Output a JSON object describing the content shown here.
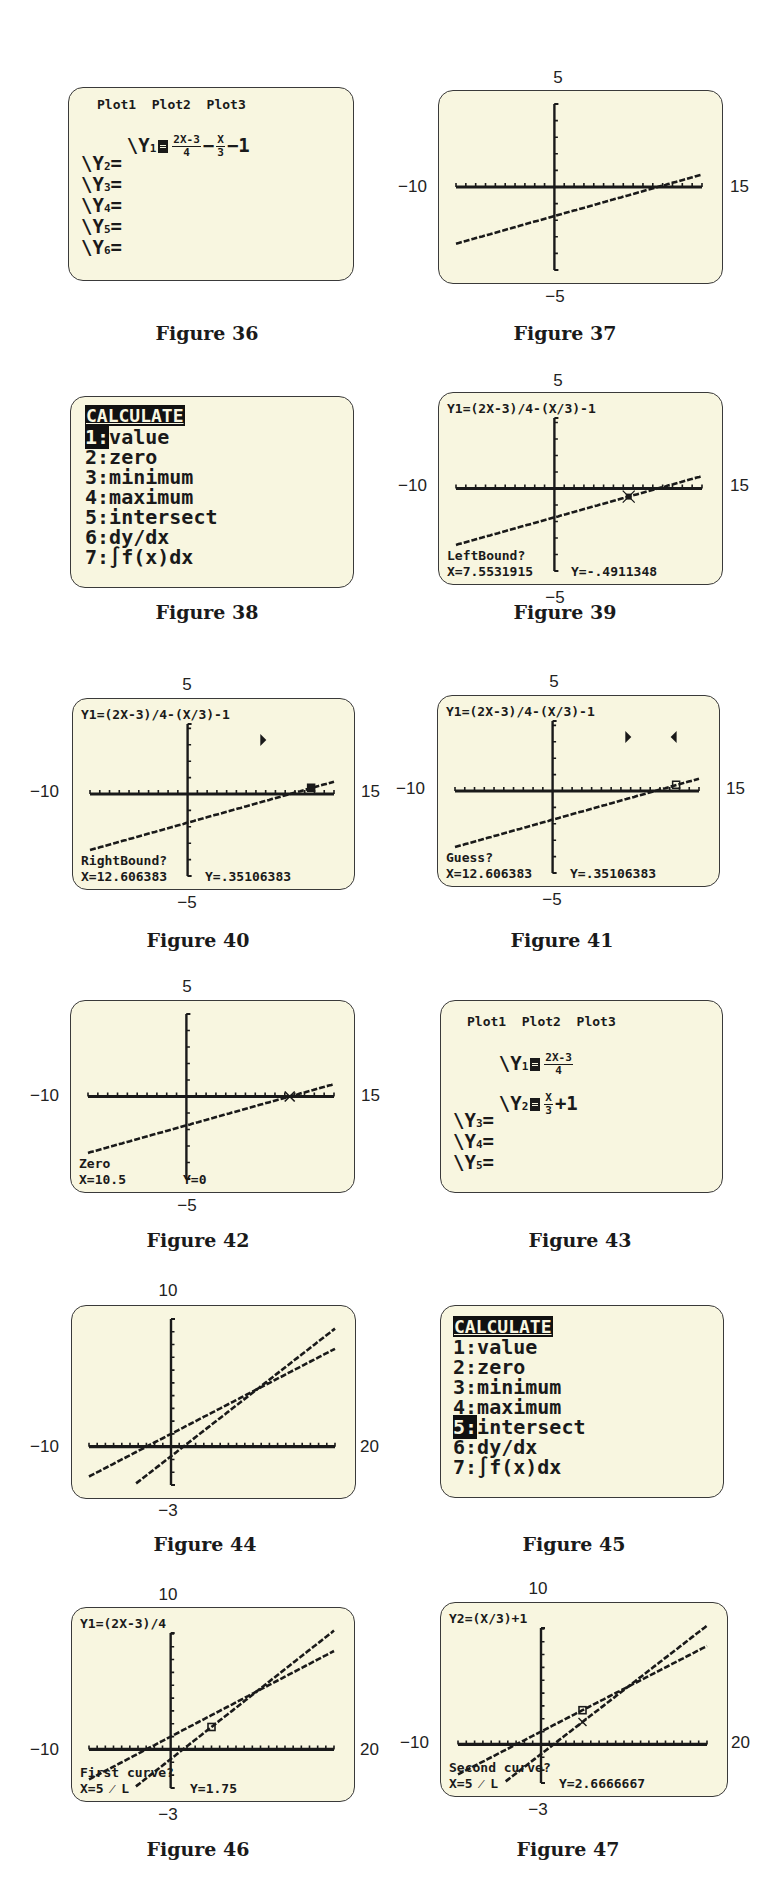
{
  "figures": [
    {
      "id": "36",
      "caption": "Figure 36",
      "type": "y-editor",
      "plots_header": "Plot1  Plot2  Plot3",
      "rows": [
        {
          "label": "Y",
          "sub": "1",
          "selected": true,
          "expr": {
            "frac1_num": "2X-3",
            "frac1_den": "4",
            "op": "−",
            "frac2_num": "X",
            "frac2_den": "3",
            "tail": "−1"
          }
        },
        {
          "label": "Y",
          "sub": "2",
          "selected": false,
          "expr": null
        },
        {
          "label": "Y",
          "sub": "3",
          "selected": false,
          "expr": null
        },
        {
          "label": "Y",
          "sub": "4",
          "selected": false,
          "expr": null
        },
        {
          "label": "Y",
          "sub": "5",
          "selected": false,
          "expr": null
        },
        {
          "label": "Y",
          "sub": "6",
          "selected": false,
          "expr": null
        }
      ]
    },
    {
      "id": "37",
      "caption": "Figure 37",
      "type": "graph",
      "window": {
        "xmin": -10,
        "xmax": 15,
        "ymin": -5,
        "ymax": 5,
        "xmin_label": "−10",
        "xmax_label": "15",
        "ymin_label": "−5",
        "ymax_label": "5"
      }
    },
    {
      "id": "38",
      "caption": "Figure 38",
      "type": "menu",
      "title": "CALCULATE",
      "items": [
        {
          "key": "1",
          "label": "value",
          "selected": true
        },
        {
          "key": "2",
          "label": "zero",
          "selected": false
        },
        {
          "key": "3",
          "label": "minimum",
          "selected": false
        },
        {
          "key": "4",
          "label": "maximum",
          "selected": false
        },
        {
          "key": "5",
          "label": "intersect",
          "selected": false
        },
        {
          "key": "6",
          "label": "dy/dx",
          "selected": false
        },
        {
          "key": "7",
          "label": "∫f(x)dx",
          "selected": false
        }
      ]
    },
    {
      "id": "39",
      "caption": "Figure 39",
      "type": "graph",
      "window": {
        "xmin": -10,
        "xmax": 15,
        "ymin": -5,
        "ymax": 5,
        "xmin_label": "−10",
        "xmax_label": "15",
        "ymin_label": "−5",
        "ymax_label": "5"
      },
      "top_text": "Y1=(2X-3)/4-(X/3)-1",
      "prompt": "LeftBound?",
      "x_readout": "X=7.5531915",
      "y_readout": "Y=-.4911348"
    },
    {
      "id": "40",
      "caption": "Figure 40",
      "type": "graph",
      "window": {
        "xmin": -10,
        "xmax": 15,
        "ymin": -5,
        "ymax": 5,
        "xmin_label": "−10",
        "xmax_label": "15",
        "ymin_label": "−5",
        "ymax_label": "5"
      },
      "top_text": "Y1=(2X-3)/4-(X/3)-1",
      "prompt": "RightBound?",
      "x_readout": "X=12.606383",
      "y_readout": "Y=.35106383",
      "markers": [
        "left-bound-marker"
      ]
    },
    {
      "id": "41",
      "caption": "Figure 41",
      "type": "graph",
      "window": {
        "xmin": -10,
        "xmax": 15,
        "ymin": -5,
        "ymax": 5,
        "xmin_label": "−10",
        "xmax_label": "15",
        "ymin_label": "−5",
        "ymax_label": "5"
      },
      "top_text": "Y1=(2X-3)/4-(X/3)-1",
      "prompt": "Guess?",
      "x_readout": "X=12.606383",
      "y_readout": "Y=.35106383",
      "markers": [
        "left-bound-marker",
        "right-bound-marker"
      ]
    },
    {
      "id": "42",
      "caption": "Figure 42",
      "type": "graph",
      "window": {
        "xmin": -10,
        "xmax": 15,
        "ymin": -5,
        "ymax": 5,
        "xmin_label": "−10",
        "xmax_label": "15",
        "ymin_label": "−5",
        "ymax_label": "5"
      },
      "prompt": "Zero",
      "x_readout": "X=10.5",
      "y_readout": "Y=0"
    },
    {
      "id": "43",
      "caption": "Figure 43",
      "type": "y-editor",
      "plots_header": "Plot1  Plot2  Plot3",
      "rows": [
        {
          "label": "Y",
          "sub": "1",
          "selected": true,
          "expr": {
            "frac1_num": "2X-3",
            "frac1_den": "4"
          }
        },
        {
          "label": "Y",
          "sub": "2",
          "selected": true,
          "expr": {
            "frac1_num": "X",
            "frac1_den": "3",
            "tail": "+1"
          }
        },
        {
          "label": "Y",
          "sub": "3",
          "selected": false,
          "expr": null
        },
        {
          "label": "Y",
          "sub": "4",
          "selected": false,
          "expr": null
        },
        {
          "label": "Y",
          "sub": "5",
          "selected": false,
          "expr": null
        }
      ]
    },
    {
      "id": "44",
      "caption": "Figure 44",
      "type": "graph",
      "window": {
        "xmin": -10,
        "xmax": 20,
        "ymin": -3,
        "ymax": 10,
        "xmin_label": "−10",
        "xmax_label": "20",
        "ymin_label": "−3",
        "ymax_label": "10"
      }
    },
    {
      "id": "45",
      "caption": "Figure 45",
      "type": "menu",
      "title": "CALCULATE",
      "items": [
        {
          "key": "1",
          "label": "value",
          "selected": false
        },
        {
          "key": "2",
          "label": "zero",
          "selected": false
        },
        {
          "key": "3",
          "label": "minimum",
          "selected": false
        },
        {
          "key": "4",
          "label": "maximum",
          "selected": false
        },
        {
          "key": "5",
          "label": "intersect",
          "selected": true
        },
        {
          "key": "6",
          "label": "dy/dx",
          "selected": false
        },
        {
          "key": "7",
          "label": "∫f(x)dx",
          "selected": false
        }
      ]
    },
    {
      "id": "46",
      "caption": "Figure 46",
      "type": "graph",
      "window": {
        "xmin": -10,
        "xmax": 20,
        "ymin": -3,
        "ymax": 10,
        "xmin_label": "−10",
        "xmax_label": "20",
        "ymin_label": "−3",
        "ymax_label": "10"
      },
      "top_text": "Y1=(2X-3)/4",
      "prompt": "First curve?",
      "x_readout": "X=5  ⁄  L",
      "y_readout": "Y=1.75"
    },
    {
      "id": "47",
      "caption": "Figure 47",
      "type": "graph",
      "window": {
        "xmin": -10,
        "xmax": 20,
        "ymin": -3,
        "ymax": 10,
        "xmin_label": "−10",
        "xmax_label": "20",
        "ymin_label": "−3",
        "ymax_label": "10"
      },
      "top_text": "Y2=(X/3)+1",
      "prompt": "Second curve?",
      "x_readout": "X=5  ⁄  L",
      "y_readout": "Y=2.6666667"
    }
  ],
  "chart_data": [
    {
      "type": "line",
      "title": "Figure 37",
      "functions": [
        "Y1=(2X-3)/4-(X/3)-1"
      ],
      "xlim": [
        -10,
        15
      ],
      "ylim": [
        -5,
        5
      ],
      "series": [
        {
          "name": "Y1",
          "x": [
            -10,
            15
          ],
          "y": [
            -3.0833,
            1.0833
          ]
        }
      ]
    },
    {
      "type": "line",
      "title": "Figure 39",
      "functions": [
        "Y1=(2X-3)/4-(X/3)-1"
      ],
      "xlim": [
        -10,
        15
      ],
      "ylim": [
        -5,
        5
      ],
      "annotations": [
        "LeftBound?",
        "X=7.5531915",
        "Y=-.4911348"
      ],
      "series": [
        {
          "name": "Y1",
          "x": [
            -10,
            15
          ],
          "y": [
            -3.0833,
            1.0833
          ]
        }
      ]
    },
    {
      "type": "line",
      "title": "Figure 40",
      "functions": [
        "Y1=(2X-3)/4-(X/3)-1"
      ],
      "xlim": [
        -10,
        15
      ],
      "ylim": [
        -5,
        5
      ],
      "annotations": [
        "RightBound?",
        "X=12.606383",
        "Y=.35106383"
      ],
      "series": [
        {
          "name": "Y1",
          "x": [
            -10,
            15
          ],
          "y": [
            -3.0833,
            1.0833
          ]
        }
      ]
    },
    {
      "type": "line",
      "title": "Figure 41",
      "functions": [
        "Y1=(2X-3)/4-(X/3)-1"
      ],
      "xlim": [
        -10,
        15
      ],
      "ylim": [
        -5,
        5
      ],
      "annotations": [
        "Guess?",
        "X=12.606383",
        "Y=.35106383"
      ],
      "series": [
        {
          "name": "Y1",
          "x": [
            -10,
            15
          ],
          "y": [
            -3.0833,
            1.0833
          ]
        }
      ]
    },
    {
      "type": "line",
      "title": "Figure 42",
      "functions": [
        "Y1=(2X-3)/4-(X/3)-1"
      ],
      "xlim": [
        -10,
        15
      ],
      "ylim": [
        -5,
        5
      ],
      "annotations": [
        "Zero",
        "X=10.5",
        "Y=0"
      ],
      "series": [
        {
          "name": "Y1",
          "x": [
            -10,
            15
          ],
          "y": [
            -3.0833,
            1.0833
          ]
        }
      ]
    },
    {
      "type": "line",
      "title": "Figure 44",
      "functions": [
        "Y1=(2X-3)/4",
        "Y2=(X/3)+1"
      ],
      "xlim": [
        -10,
        20
      ],
      "ylim": [
        -3,
        10
      ],
      "series": [
        {
          "name": "Y1",
          "x": [
            -4.5,
            20
          ],
          "y": [
            -3,
            9.25
          ]
        },
        {
          "name": "Y2",
          "x": [
            -10,
            20
          ],
          "y": [
            -2.3333,
            7.6667
          ]
        }
      ]
    },
    {
      "type": "line",
      "title": "Figure 46",
      "functions": [
        "Y1=(2X-3)/4",
        "Y2=(X/3)+1"
      ],
      "xlim": [
        -10,
        20
      ],
      "ylim": [
        -3,
        10
      ],
      "annotations": [
        "First curve?",
        "X=5",
        "Y=1.75"
      ],
      "series": [
        {
          "name": "Y1",
          "x": [
            -4.5,
            20
          ],
          "y": [
            -3,
            9.25
          ]
        },
        {
          "name": "Y2",
          "x": [
            -10,
            20
          ],
          "y": [
            -2.3333,
            7.6667
          ]
        }
      ]
    },
    {
      "type": "line",
      "title": "Figure 47",
      "functions": [
        "Y1=(2X-3)/4",
        "Y2=(X/3)+1"
      ],
      "xlim": [
        -10,
        20
      ],
      "ylim": [
        -3,
        10
      ],
      "annotations": [
        "Second curve?",
        "X=5",
        "Y=2.6666667"
      ],
      "series": [
        {
          "name": "Y1",
          "x": [
            -4.5,
            20
          ],
          "y": [
            -3,
            9.25
          ]
        },
        {
          "name": "Y2",
          "x": [
            -10,
            20
          ],
          "y": [
            -2.3333,
            7.6667
          ]
        }
      ]
    }
  ],
  "colors": {
    "screen_bg": "#f8f6e0",
    "ink": "#1a1a1a",
    "border": "#3a3a3a"
  }
}
